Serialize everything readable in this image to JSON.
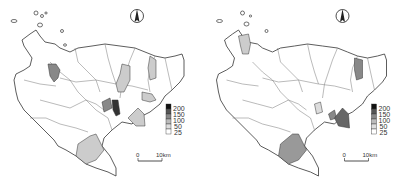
{
  "maps": [
    {
      "id": "left",
      "legend": {
        "ticks": [
          "200",
          "150",
          "100",
          "50",
          "25"
        ],
        "classes": [
          {
            "range": "150-200",
            "color": "#111111"
          },
          {
            "range": "100-150",
            "color": "#555555"
          },
          {
            "range": "50-100",
            "color": "#888888"
          },
          {
            "range": "25-50",
            "color": "#bbbbbb"
          },
          {
            "range": "0-25",
            "color": "#dddddd"
          },
          {
            "range": "0",
            "color": "#ffffff"
          }
        ]
      },
      "scale_bar": {
        "start": "0",
        "end": "10km"
      },
      "north_arrow": "N"
    },
    {
      "id": "right",
      "legend": {
        "ticks": [
          "200",
          "150",
          "100",
          "50",
          "25"
        ],
        "classes": [
          {
            "range": "150-200",
            "color": "#111111"
          },
          {
            "range": "100-150",
            "color": "#555555"
          },
          {
            "range": "50-100",
            "color": "#888888"
          },
          {
            "range": "25-50",
            "color": "#bbbbbb"
          },
          {
            "range": "0-25",
            "color": "#dddddd"
          },
          {
            "range": "0",
            "color": "#ffffff"
          }
        ]
      },
      "scale_bar": {
        "start": "0",
        "end": "10km"
      },
      "north_arrow": "N"
    }
  ],
  "colors": {
    "outline": "#333333",
    "background": "#ffffff"
  }
}
